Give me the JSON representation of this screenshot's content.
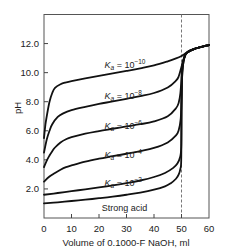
{
  "chart_data": {
    "type": "line",
    "title": "",
    "xlabel": "Volume of 0.1000-F NaOH, ml",
    "ylabel": "pH",
    "xlim": [
      0,
      60
    ],
    "ylim": [
      0,
      14
    ],
    "x_ticks": [
      0,
      10,
      20,
      30,
      40,
      50,
      60
    ],
    "x_tick_labels": [
      "0",
      "10",
      "20",
      "30",
      "40",
      "50",
      "60"
    ],
    "y_ticks": [
      2,
      4,
      6,
      8,
      10,
      12
    ],
    "y_tick_labels": [
      "2.0",
      "4.0",
      "6.0",
      "8.0",
      "10.0",
      "12.0"
    ],
    "grid": false,
    "legend": "inline labels",
    "annotations": [
      {
        "type": "vertical-dashed-line",
        "x": 50,
        "meaning": "equivalence point"
      }
    ],
    "series": [
      {
        "name": "Ka = 10^-10",
        "label_prefix": "K",
        "label_sub": "a",
        "label_mid": " = 10",
        "label_exp": "−10",
        "label_pos": [
          22,
          10.3
        ],
        "x": [
          0,
          0.5,
          1,
          2,
          3,
          4,
          6,
          8,
          10,
          15,
          20,
          25,
          30,
          35,
          40,
          45,
          48,
          50,
          52,
          55,
          60
        ],
        "values": [
          5.5,
          6.4,
          7.0,
          8.0,
          8.6,
          8.95,
          9.2,
          9.33,
          9.42,
          9.6,
          9.78,
          9.95,
          10.12,
          10.3,
          10.5,
          10.78,
          10.98,
          11.15,
          11.38,
          11.65,
          11.9
        ]
      },
      {
        "name": "Ka = 10^-8",
        "label_prefix": "K",
        "label_sub": "a",
        "label_mid": " = 10",
        "label_exp": "−8",
        "label_pos": [
          22,
          8.2
        ],
        "x": [
          0,
          1,
          2,
          3,
          5,
          7,
          10,
          15,
          20,
          25,
          30,
          35,
          40,
          45,
          48,
          49,
          50,
          51,
          52,
          55,
          60
        ],
        "values": [
          4.5,
          5.4,
          6.0,
          6.45,
          6.95,
          7.2,
          7.42,
          7.65,
          7.85,
          8.02,
          8.2,
          8.38,
          8.6,
          8.98,
          9.45,
          9.75,
          10.4,
          11.05,
          11.38,
          11.65,
          11.9
        ]
      },
      {
        "name": "Ka = 10^-6",
        "label_prefix": "K",
        "label_sub": "a",
        "label_mid": " = 10",
        "label_exp": "−6",
        "label_pos": [
          22,
          6.1
        ],
        "x": [
          0,
          1,
          2,
          3,
          4,
          6,
          8,
          10,
          15,
          20,
          25,
          30,
          35,
          40,
          45,
          48,
          49,
          49.6,
          50,
          50.4,
          51,
          52,
          55,
          60
        ],
        "values": [
          3.5,
          3.95,
          4.3,
          4.6,
          4.85,
          5.2,
          5.42,
          5.56,
          5.8,
          5.98,
          6.14,
          6.3,
          6.45,
          6.65,
          7.0,
          7.55,
          7.95,
          8.6,
          9.6,
          10.6,
          11.05,
          11.38,
          11.65,
          11.9
        ]
      },
      {
        "name": "Ka = 10^-4",
        "label_prefix": "K",
        "label_sub": "a",
        "label_mid": " = 10",
        "label_exp": "−4",
        "label_pos": [
          22,
          4.1
        ],
        "x": [
          0,
          2,
          4,
          6,
          8,
          10,
          15,
          20,
          25,
          30,
          35,
          40,
          45,
          48,
          49,
          49.7,
          50,
          50.3,
          51,
          52,
          55,
          60
        ],
        "values": [
          2.5,
          2.85,
          3.1,
          3.32,
          3.5,
          3.62,
          3.88,
          4.08,
          4.25,
          4.42,
          4.6,
          4.82,
          5.2,
          5.68,
          6.05,
          6.8,
          8.2,
          10.0,
          11.0,
          11.38,
          11.65,
          11.9
        ]
      },
      {
        "name": "Ka = 10^-2",
        "label_prefix": "K",
        "label_sub": "a",
        "label_mid": " = 10",
        "label_exp": "−2",
        "label_pos": [
          22,
          2.2
        ],
        "x": [
          0,
          5,
          10,
          15,
          20,
          25,
          30,
          35,
          40,
          44,
          47,
          48.5,
          49.5,
          49.9,
          50,
          50.2,
          50.6,
          51,
          52,
          55,
          60
        ],
        "values": [
          1.6,
          1.72,
          1.85,
          1.97,
          2.1,
          2.24,
          2.4,
          2.58,
          2.82,
          3.1,
          3.45,
          3.75,
          4.2,
          4.9,
          7.2,
          9.6,
          10.6,
          11.0,
          11.38,
          11.65,
          11.9
        ]
      },
      {
        "name": "Strong acid",
        "label_text": "Strong acid",
        "label_pos": [
          21,
          0.45
        ],
        "x": [
          0,
          5,
          10,
          15,
          20,
          25,
          30,
          35,
          40,
          44,
          46,
          48,
          49,
          49.6,
          49.9,
          50,
          50.1,
          50.4,
          51,
          52,
          55,
          60
        ],
        "values": [
          1.0,
          1.08,
          1.17,
          1.26,
          1.36,
          1.47,
          1.6,
          1.75,
          1.95,
          2.18,
          2.38,
          2.7,
          3.0,
          3.4,
          4.0,
          7.0,
          10.0,
          10.6,
          11.0,
          11.38,
          11.65,
          11.9
        ]
      }
    ]
  }
}
